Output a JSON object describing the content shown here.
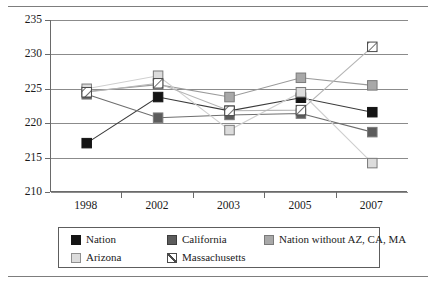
{
  "chart_data": {
    "type": "line",
    "title": "",
    "subtitle": "",
    "xlabel": "",
    "ylabel": "Scale score",
    "categories": [
      "1998",
      "2002",
      "2003",
      "2005",
      "2007"
    ],
    "ylim": [
      210,
      235
    ],
    "yticks": [
      210,
      215,
      220,
      225,
      230,
      235
    ],
    "grid": "horizontal",
    "legend_position": "bottom",
    "series": [
      {
        "name": "Nation",
        "color": "#141414",
        "marker": "filled-square",
        "values": [
          217.1,
          223.8,
          221.8,
          223.7,
          221.6
        ]
      },
      {
        "name": "California",
        "color": "#5c5c5c",
        "marker": "dark-gray-square",
        "values": [
          224.2,
          220.8,
          221.2,
          221.4,
          218.7
        ]
      },
      {
        "name": "Nation without AZ, CA, MA",
        "color": "#a8a8a8",
        "marker": "gray-square",
        "values": [
          224.6,
          225.6,
          223.8,
          226.6,
          225.5
        ]
      },
      {
        "name": "Arizona",
        "color": "#dcdcdc",
        "marker": "light-gray-square",
        "values": [
          225.0,
          226.9,
          219.0,
          224.5,
          214.2
        ]
      },
      {
        "name": "Massachusetts",
        "color": "#ffffff",
        "marker": "hatched-square",
        "values": [
          224.5,
          225.8,
          221.8,
          221.9,
          231.1
        ]
      }
    ]
  },
  "axis": {
    "y_label": "Scale score",
    "y_tick_labels": [
      "235",
      "230",
      "225",
      "220",
      "215",
      "210"
    ],
    "x_tick_labels": [
      "1998",
      "2002",
      "2003",
      "2005",
      "2007"
    ]
  },
  "legend": {
    "rows": [
      [
        {
          "label": "Nation",
          "swatch": "nation"
        },
        {
          "label": "California",
          "swatch": "california"
        },
        {
          "label": "Nation without AZ, CA, MA",
          "swatch": "nation-without"
        }
      ],
      [
        {
          "label": "Arizona",
          "swatch": "arizona"
        },
        {
          "label": "Massachusetts",
          "swatch": "massachusetts"
        }
      ]
    ]
  }
}
